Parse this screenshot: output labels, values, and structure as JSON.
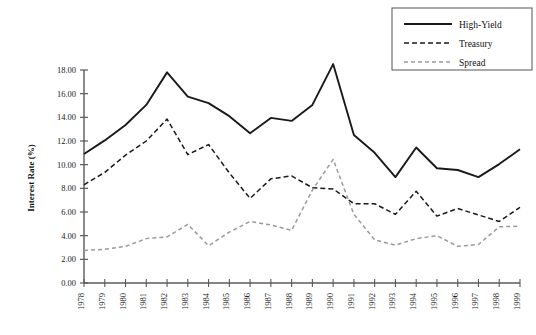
{
  "chart_data": {
    "type": "line",
    "title": "",
    "xlabel": "",
    "ylabel": "Interest Rate (%)",
    "ylim": [
      0.0,
      18.0
    ],
    "yticks": [
      "0.00",
      "2.00",
      "4.00",
      "6.00",
      "8.00",
      "10.00",
      "12.00",
      "14.00",
      "16.00",
      "18.00"
    ],
    "ytick_values": [
      0,
      2,
      4,
      6,
      8,
      10,
      12,
      14,
      16,
      18
    ],
    "grid": false,
    "legend_position": "top-right",
    "categories": [
      "1978",
      "1979",
      "1980",
      "1981",
      "1982",
      "1983",
      "1984",
      "1985",
      "1986",
      "1987",
      "1988",
      "1989",
      "1990",
      "1991",
      "1992",
      "1993",
      "1994",
      "1995",
      "1996",
      "1997",
      "1998",
      "1999"
    ],
    "series": [
      {
        "name": "High-Yield",
        "style": "solid",
        "color": "#1a1a1a",
        "values": [
          10.9,
          12.05,
          13.35,
          15.05,
          17.8,
          15.75,
          15.2,
          14.1,
          12.65,
          13.95,
          13.7,
          15.05,
          18.5,
          12.5,
          11.0,
          8.95,
          11.45,
          9.7,
          9.55,
          8.95,
          10.05,
          11.3
        ]
      },
      {
        "name": "Treasury",
        "style": "dashed",
        "color": "#1a1a1a",
        "values": [
          8.3,
          9.35,
          10.8,
          12.0,
          13.85,
          10.85,
          11.7,
          9.3,
          7.15,
          8.8,
          9.05,
          8.05,
          7.95,
          6.7,
          6.7,
          5.8,
          7.75,
          5.65,
          6.3,
          5.75,
          5.2,
          6.4
        ]
      },
      {
        "name": "Spread",
        "style": "dashed",
        "color": "#9a9a9a",
        "values": [
          2.75,
          2.85,
          3.1,
          3.75,
          3.9,
          4.95,
          3.15,
          4.3,
          5.2,
          4.9,
          4.45,
          7.85,
          10.45,
          5.8,
          3.65,
          3.2,
          3.75,
          4.0,
          3.1,
          3.25,
          4.75,
          4.8
        ]
      }
    ]
  },
  "legend": {
    "entries": [
      {
        "label": "High-Yield"
      },
      {
        "label": "Treasury"
      },
      {
        "label": "Spread"
      }
    ]
  },
  "axis": {
    "y_title": "Interest Rate (%)"
  }
}
